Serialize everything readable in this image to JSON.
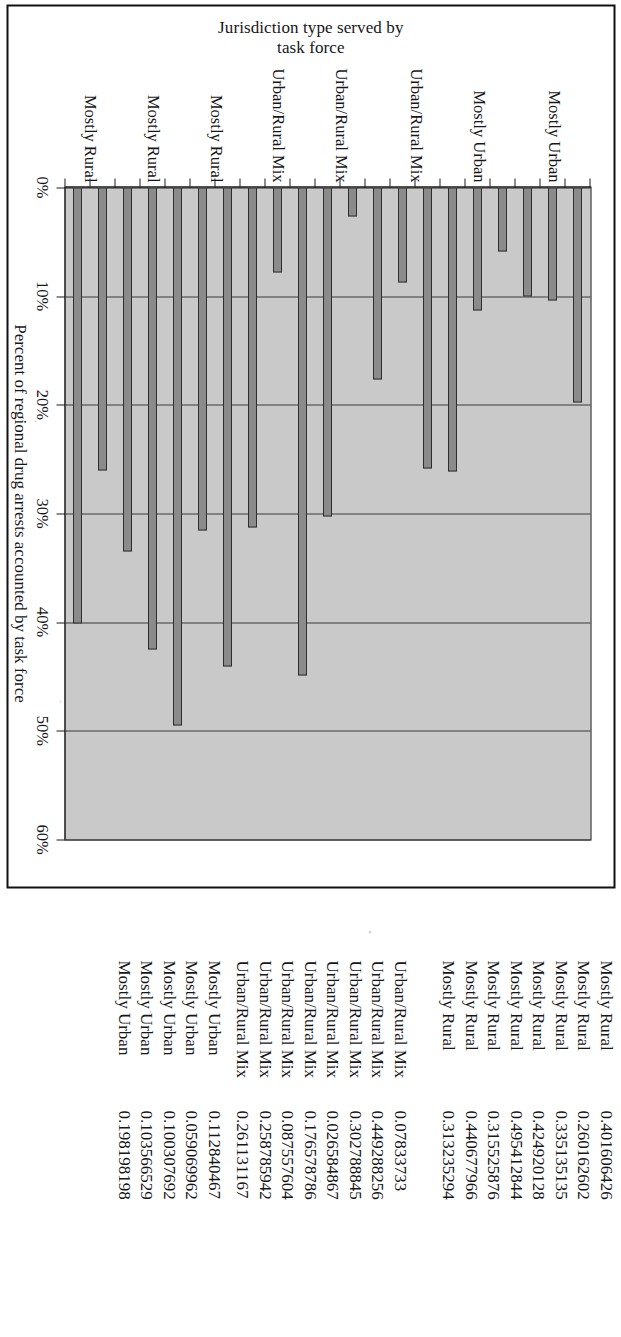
{
  "chart_data": {
    "type": "bar",
    "orientation": "horizontal",
    "title": "",
    "xlabel": "Percent of regional drug arrests accounted by task force",
    "ylabel": "Jurisdiction type served by\ntask force",
    "xlim": [
      0,
      0.6
    ],
    "xticks": [
      0,
      0.1,
      0.2,
      0.3,
      0.4,
      0.5,
      0.6
    ],
    "xtick_labels": [
      "0%",
      "10%",
      "20%",
      "30%",
      "40%",
      "50%",
      "60%"
    ],
    "grid": true,
    "legend": "none",
    "plot_background": "#c9c9c9",
    "bar_color": "#8b8b8b",
    "bar_edge_color": "#2e2e2e",
    "category_group_labels": [
      "Mostly Urban",
      "Mostly Urban",
      "Urban/Rural Mix",
      "Urban/Rural Mix",
      "Urban/Rural Mix",
      "Mostly Rural",
      "Mostly Rural",
      "Mostly Rural"
    ],
    "categories": [
      "Mostly Urban",
      "Mostly Urban",
      "Mostly Urban",
      "Mostly Urban",
      "Mostly Urban",
      "Urban/Rural Mix",
      "Urban/Rural Mix",
      "Urban/Rural Mix",
      "Urban/Rural Mix",
      "Urban/Rural Mix",
      "Urban/Rural Mix",
      "Urban/Rural Mix",
      "Urban/Rural Mix",
      "Mostly Rural",
      "Mostly Rural",
      "Mostly Rural",
      "Mostly Rural",
      "Mostly Rural",
      "Mostly Rural",
      "Mostly Rural",
      "Mostly Rural"
    ],
    "values": [
      0.198198198,
      0.103566529,
      0.100307692,
      0.059069962,
      0.112840467,
      0.261131167,
      0.258785942,
      0.087557604,
      0.176578786,
      0.026584867,
      0.302788845,
      0.449288256,
      0.07833733,
      0.313235294,
      0.440677966,
      0.315525876,
      0.495412844,
      0.424920128,
      0.335135135,
      0.260162602,
      0.401606426
    ]
  },
  "data_list": {
    "groups": [
      {
        "rows": [
          {
            "label": "Mostly Rural",
            "value": "0.401606426"
          },
          {
            "label": "Mostly Rural",
            "value": "0.260162602"
          },
          {
            "label": "Mostly Rural",
            "value": "0.335135135"
          },
          {
            "label": "Mostly Rural",
            "value": "0.424920128"
          },
          {
            "label": "Mostly Rural",
            "value": "0.495412844"
          },
          {
            "label": "Mostly Rural",
            "value": "0.315525876"
          },
          {
            "label": "Mostly Rural",
            "value": "0.440677966"
          },
          {
            "label": "Mostly Rural",
            "value": "0.313235294"
          }
        ]
      },
      {
        "rows": [
          {
            "label": "Urban/Rural Mix",
            "value": "0.07833733"
          },
          {
            "label": "Urban/Rural Mix",
            "value": "0.449288256"
          },
          {
            "label": "Urban/Rural Mix",
            "value": "0.302788845"
          },
          {
            "label": "Urban/Rural Mix",
            "value": "0.026584867"
          },
          {
            "label": "Urban/Rural Mix",
            "value": "0.176578786"
          },
          {
            "label": "Urban/Rural Mix",
            "value": "0.087557604"
          },
          {
            "label": "Urban/Rural Mix",
            "value": "0.258785942"
          },
          {
            "label": "Urban/Rural Mix",
            "value": "0.261131167"
          }
        ]
      },
      {
        "rows": [
          {
            "label": "Mostly Urban",
            "value": "0.112840467"
          },
          {
            "label": "Mostly Urban",
            "value": "0.059069962"
          },
          {
            "label": "Mostly Urban",
            "value": "0.100307692"
          },
          {
            "label": "Mostly Urban",
            "value": "0.103566529"
          },
          {
            "label": "Mostly Urban",
            "value": "0.198198198"
          }
        ]
      }
    ]
  }
}
